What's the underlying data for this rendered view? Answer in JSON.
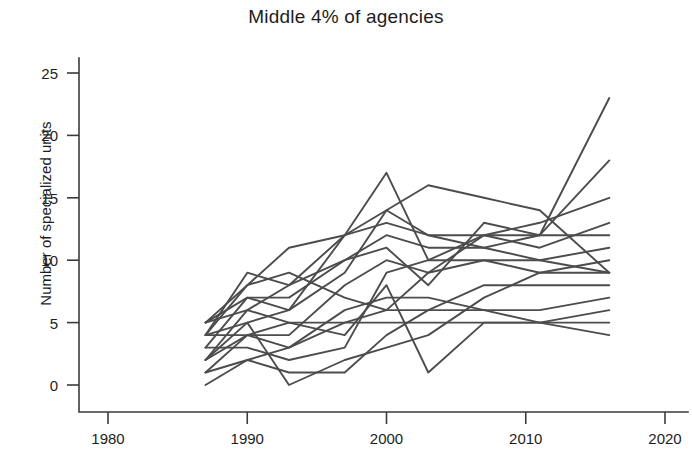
{
  "chart_data": {
    "type": "line",
    "title": "Middle 4% of agencies",
    "xlabel": "",
    "ylabel": "Number of specialized units",
    "xlim": [
      1976,
      2022
    ],
    "ylim": [
      -1.2,
      27
    ],
    "xticks": [
      1980,
      1990,
      2000,
      2010,
      2020
    ],
    "xtick_labels": [
      "1980",
      "1990",
      "2000",
      "2010",
      "2020"
    ],
    "yticks": [
      0,
      5,
      10,
      15,
      20,
      25
    ],
    "ytick_labels": [
      "0",
      "5",
      "10",
      "15",
      "20",
      "25"
    ],
    "grid": false,
    "legend": null,
    "line_color": "#4c4c4c",
    "series": [
      {
        "name": "agency-1",
        "x": [
          1987,
          1990,
          1993,
          1997,
          2000,
          2003,
          2007,
          2011,
          2016
        ],
        "values": [
          5,
          8,
          11,
          12,
          14,
          16,
          15,
          14,
          9
        ]
      },
      {
        "name": "agency-2",
        "x": [
          1987,
          1990,
          1993,
          1997,
          2000,
          2003,
          2007,
          2011,
          2016
        ],
        "values": [
          4,
          9,
          8,
          12,
          17,
          10,
          12,
          13,
          15
        ]
      },
      {
        "name": "agency-3",
        "x": [
          1987,
          1990,
          1993,
          1997,
          2000,
          2003,
          2007,
          2011,
          2016
        ],
        "values": [
          3,
          7,
          6,
          9,
          14,
          12,
          12,
          11,
          13
        ]
      },
      {
        "name": "agency-4",
        "x": [
          1987,
          1990,
          1993,
          1997,
          2000,
          2003,
          2007,
          2011,
          2016
        ],
        "values": [
          2,
          6,
          8,
          10,
          11,
          8,
          13,
          12,
          23
        ]
      },
      {
        "name": "agency-5",
        "x": [
          1987,
          1990,
          1993,
          1997,
          2000,
          2003,
          2007,
          2011,
          2016
        ],
        "values": [
          5,
          7,
          7,
          10,
          12,
          11,
          11,
          12,
          18
        ]
      },
      {
        "name": "agency-6",
        "x": [
          1987,
          1990,
          1993,
          1997,
          2000,
          2003,
          2007,
          2011,
          2016
        ],
        "values": [
          4,
          5,
          6,
          12,
          13,
          12,
          11,
          10,
          11
        ]
      },
      {
        "name": "agency-7",
        "x": [
          1987,
          1990,
          1993,
          1997,
          2000,
          2003,
          2007,
          2011,
          2016
        ],
        "values": [
          1,
          4,
          4,
          8,
          10,
          9,
          10,
          10,
          9
        ]
      },
      {
        "name": "agency-8",
        "x": [
          1987,
          1990,
          1993,
          1997,
          2000,
          2003,
          2007,
          2011,
          2016
        ],
        "values": [
          3,
          3,
          2,
          3,
          9,
          10,
          10,
          9,
          9
        ]
      },
      {
        "name": "agency-9",
        "x": [
          1987,
          1990,
          1993,
          1997,
          2000,
          2003,
          2007,
          2011,
          2016
        ],
        "values": [
          1,
          2,
          1,
          1,
          4,
          6,
          8,
          8,
          8
        ]
      },
      {
        "name": "agency-10",
        "x": [
          1987,
          1990,
          1993,
          1997,
          2000,
          2003,
          2007,
          2011,
          2016
        ],
        "values": [
          0,
          2,
          3,
          5,
          6,
          6,
          6,
          6,
          7
        ]
      },
      {
        "name": "agency-11",
        "x": [
          1987,
          1990,
          1993,
          1997,
          2000,
          2003,
          2007,
          2011,
          2016
        ],
        "values": [
          2,
          4,
          5,
          5,
          5,
          5,
          5,
          5,
          6
        ]
      },
      {
        "name": "agency-12",
        "x": [
          1987,
          1990,
          1993,
          1997,
          2000,
          2003,
          2007,
          2011,
          2016
        ],
        "values": [
          4,
          4,
          3,
          6,
          7,
          7,
          6,
          5,
          5
        ]
      },
      {
        "name": "agency-13",
        "x": [
          1987,
          1990,
          1993,
          1997,
          2000,
          2003,
          2007,
          2011,
          2016
        ],
        "values": [
          5,
          6,
          5,
          4,
          8,
          1,
          5,
          5,
          4
        ]
      },
      {
        "name": "agency-14",
        "x": [
          1987,
          1990,
          1993,
          1997,
          2000,
          2003,
          2007,
          2011,
          2016
        ],
        "values": [
          2,
          5,
          0,
          2,
          3,
          4,
          7,
          9,
          10
        ]
      },
      {
        "name": "agency-15",
        "x": [
          1987,
          1990,
          1993,
          1997,
          2000,
          2003,
          2007,
          2011,
          2016
        ],
        "values": [
          4,
          8,
          9,
          7,
          6,
          9,
          12,
          12,
          12
        ]
      }
    ]
  }
}
